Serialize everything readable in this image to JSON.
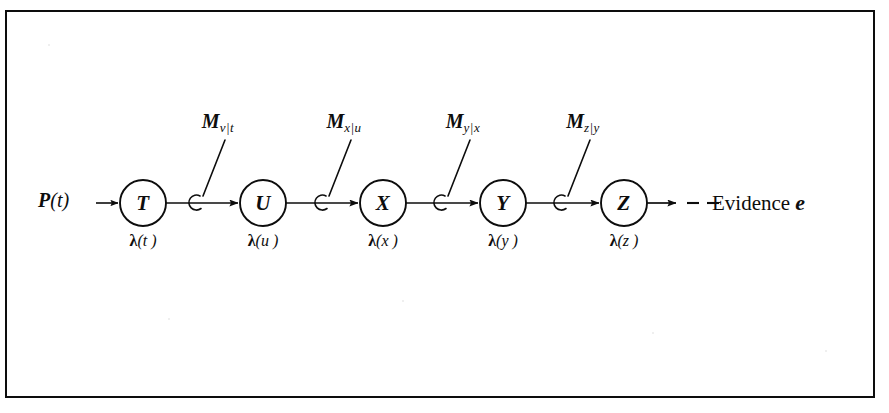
{
  "figure": {
    "kind": "belief-propagation-chain-diagram",
    "background_color": "#ffffff",
    "ink_color": "#0d0d0d",
    "border": {
      "color": "#0d0d0d",
      "width_px": 2.5
    }
  },
  "prior": {
    "text": "P (t)",
    "p_symbol": "P",
    "argument": "(t)"
  },
  "nodes": [
    {
      "id": "T",
      "label": "T",
      "cx": 143,
      "cy": 203,
      "r": 23
    },
    {
      "id": "U",
      "label": "U",
      "cx": 263,
      "cy": 203,
      "r": 23
    },
    {
      "id": "X",
      "label": "X",
      "cx": 383,
      "cy": 203,
      "r": 23
    },
    {
      "id": "Y",
      "label": "Y",
      "cx": 503,
      "cy": 203,
      "r": 23
    },
    {
      "id": "Z",
      "label": "Z",
      "cx": 624,
      "cy": 203,
      "r": 23
    }
  ],
  "lambda_labels": [
    {
      "for_node": "T",
      "lambda": "λ",
      "arg": "(t )",
      "cx": 143,
      "y": 232
    },
    {
      "for_node": "U",
      "lambda": "λ",
      "arg": "(u )",
      "cx": 263,
      "y": 232
    },
    {
      "for_node": "X",
      "lambda": "λ",
      "arg": "(x )",
      "cx": 383,
      "y": 232
    },
    {
      "for_node": "Y",
      "lambda": "λ",
      "arg": "(y )",
      "cx": 503,
      "y": 232
    },
    {
      "for_node": "Z",
      "lambda": "λ",
      "arg": "(z )",
      "cx": 624,
      "y": 232
    }
  ],
  "messages": [
    {
      "id": "m-u-t",
      "m": "M",
      "subscript": "v|t",
      "from": "T",
      "to": "U",
      "label_cx": 218,
      "label_y": 110,
      "hook_x": 196,
      "hook_y": 203
    },
    {
      "id": "m-x-u",
      "m": "M",
      "subscript": "x|u",
      "from": "U",
      "to": "X",
      "label_cx": 344,
      "label_y": 110,
      "hook_x": 322,
      "hook_y": 203
    },
    {
      "id": "m-y-x",
      "m": "M",
      "subscript": "y|x",
      "from": "X",
      "to": "Y",
      "label_cx": 463,
      "label_y": 110,
      "hook_x": 441,
      "hook_y": 203
    },
    {
      "id": "m-z-y",
      "m": "M",
      "subscript": "z|y",
      "from": "Y",
      "to": "Z",
      "label_cx": 583,
      "label_y": 110,
      "hook_x": 561,
      "hook_y": 203
    }
  ],
  "evidence": {
    "text": "Evidence",
    "symbol": "e",
    "dash_count": 2
  }
}
